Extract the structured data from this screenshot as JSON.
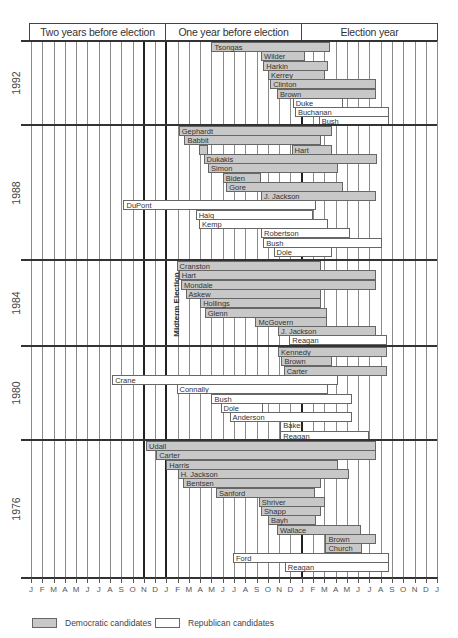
{
  "chart_data": {
    "type": "gantt",
    "title": "",
    "header_periods": [
      "Two years before election",
      "One year before election",
      "Election year"
    ],
    "x_axis": {
      "unit": "month",
      "tick_labels": [
        "J",
        "F",
        "M",
        "A",
        "M",
        "J",
        "J",
        "A",
        "S",
        "O",
        "N",
        "D",
        "J",
        "F",
        "M",
        "A",
        "M",
        "J",
        "J",
        "A",
        "S",
        "O",
        "N",
        "D",
        "J",
        "F",
        "M",
        "A",
        "M",
        "J",
        "J",
        "A",
        "S",
        "O",
        "N",
        "D",
        "J"
      ],
      "origin_note": "month offset 0 = January two years before the election; 24 = January of election year"
    },
    "annotations": [
      {
        "text": "Midterm Election",
        "month": 10
      }
    ],
    "legend": [
      {
        "label": "Democratic candidates",
        "party": "dem",
        "color": "#c8c8c8"
      },
      {
        "label": "Republican candidates",
        "party": "rep",
        "color": "#ffffff"
      }
    ],
    "sections": [
      {
        "year": "1992",
        "candidates": [
          {
            "name": "Tsongas",
            "party": "dem",
            "start": 16.0,
            "end": 26.5
          },
          {
            "name": "Wilder",
            "party": "dem",
            "start": 20.4,
            "end": 24.3
          },
          {
            "name": "Harkin",
            "party": "dem",
            "start": 20.6,
            "end": 26.3
          },
          {
            "name": "Kerrey",
            "party": "dem",
            "start": 21.0,
            "end": 26.1
          },
          {
            "name": "Clinton",
            "party": "dem",
            "start": 21.2,
            "end": 30.6
          },
          {
            "name": "Brown",
            "party": "dem",
            "start": 21.8,
            "end": 30.6
          },
          {
            "name": "Duke",
            "party": "rep",
            "start": 23.2,
            "end": 27.7
          },
          {
            "name": "Buchanan",
            "party": "rep",
            "start": 23.4,
            "end": 31.7
          },
          {
            "name": "Bush",
            "party": "rep",
            "start": 25.5,
            "end": 31.7
          }
        ]
      },
      {
        "year": "1988",
        "candidates": [
          {
            "name": "Gephardt",
            "party": "dem",
            "start": 13.1,
            "end": 26.7
          },
          {
            "name": "Babbit",
            "party": "dem",
            "start": 13.6,
            "end": 25.7
          },
          {
            "name": "Hart",
            "party": "dem",
            "start": 14.9,
            "end": 15.7,
            "label": false
          },
          {
            "name": "Hart",
            "party": "dem",
            "start": 23.1,
            "end": 26.7
          },
          {
            "name": "Dukakis",
            "party": "dem",
            "start": 15.3,
            "end": 30.7
          },
          {
            "name": "Simon",
            "party": "dem",
            "start": 15.7,
            "end": 27.2
          },
          {
            "name": "Biden",
            "party": "dem",
            "start": 17.0,
            "end": 20.4
          },
          {
            "name": "Gore",
            "party": "dem",
            "start": 17.3,
            "end": 27.7
          },
          {
            "name": "J. Jackson",
            "party": "dem",
            "start": 20.4,
            "end": 30.6
          },
          {
            "name": "DuPont",
            "party": "rep",
            "start": 8.2,
            "end": 25.3
          },
          {
            "name": "Haig",
            "party": "rep",
            "start": 14.6,
            "end": 25.0
          },
          {
            "name": "Kemp",
            "party": "rep",
            "start": 14.9,
            "end": 26.3
          },
          {
            "name": "Robertson",
            "party": "rep",
            "start": 20.4,
            "end": 28.3
          },
          {
            "name": "Bush",
            "party": "rep",
            "start": 20.6,
            "end": 31.1
          },
          {
            "name": "Dole",
            "party": "rep",
            "start": 21.5,
            "end": 26.7
          }
        ]
      },
      {
        "year": "1984",
        "candidates": [
          {
            "name": "Cranston",
            "party": "dem",
            "start": 12.9,
            "end": 25.7
          },
          {
            "name": "Hart",
            "party": "dem",
            "start": 13.1,
            "end": 30.6
          },
          {
            "name": "Mondale",
            "party": "dem",
            "start": 13.3,
            "end": 30.6
          },
          {
            "name": "Askew",
            "party": "dem",
            "start": 13.7,
            "end": 25.7
          },
          {
            "name": "Hollings",
            "party": "dem",
            "start": 15.0,
            "end": 25.7
          },
          {
            "name": "Glenn",
            "party": "dem",
            "start": 15.4,
            "end": 26.2
          },
          {
            "name": "McGovern",
            "party": "dem",
            "start": 19.9,
            "end": 26.2
          },
          {
            "name": "J. Jackson",
            "party": "dem",
            "start": 21.9,
            "end": 30.6
          },
          {
            "name": "Reagan",
            "party": "rep",
            "start": 22.9,
            "end": 31.6
          }
        ]
      },
      {
        "year": "1980",
        "candidates": [
          {
            "name": "Kennedy",
            "party": "dem",
            "start": 21.9,
            "end": 31.6
          },
          {
            "name": "Brown",
            "party": "dem",
            "start": 22.2,
            "end": 26.7
          },
          {
            "name": "Carter",
            "party": "dem",
            "start": 22.4,
            "end": 31.6
          },
          {
            "name": "Crane",
            "party": "rep",
            "start": 7.2,
            "end": 27.2
          },
          {
            "name": "Connally",
            "party": "rep",
            "start": 12.9,
            "end": 26.3
          },
          {
            "name": "Bush",
            "party": "rep",
            "start": 16.0,
            "end": 28.5
          },
          {
            "name": "Dole",
            "party": "rep",
            "start": 16.8,
            "end": 20.6
          },
          {
            "name": "Anderson",
            "party": "rep",
            "start": 17.6,
            "end": 28.5
          },
          {
            "name": "Baker",
            "party": "rep",
            "start": 22.1,
            "end": 26.3,
            "label_only": true
          },
          {
            "name": "Reagan",
            "party": "rep",
            "start": 22.1,
            "end": 30.0
          }
        ]
      },
      {
        "year": "1976",
        "candidates": [
          {
            "name": "Udall",
            "party": "dem",
            "start": 10.2,
            "end": 30.6
          },
          {
            "name": "Carter",
            "party": "dem",
            "start": 11.1,
            "end": 30.6
          },
          {
            "name": "Harris",
            "party": "dem",
            "start": 12.0,
            "end": 27.2
          },
          {
            "name": "H. Jackson",
            "party": "dem",
            "start": 13.0,
            "end": 28.2
          },
          {
            "name": "Bentsen",
            "party": "dem",
            "start": 13.5,
            "end": 25.7
          },
          {
            "name": "Sanford",
            "party": "dem",
            "start": 16.4,
            "end": 25.2
          },
          {
            "name": "Shriver",
            "party": "dem",
            "start": 20.2,
            "end": 26.1
          },
          {
            "name": "Shapp",
            "party": "dem",
            "start": 20.4,
            "end": 25.7
          },
          {
            "name": "Bayh",
            "party": "dem",
            "start": 21.0,
            "end": 25.3
          },
          {
            "name": "Wallace",
            "party": "dem",
            "start": 21.8,
            "end": 29.3
          },
          {
            "name": "Brown",
            "party": "dem",
            "start": 26.1,
            "end": 30.6
          },
          {
            "name": "Church",
            "party": "dem",
            "start": 26.1,
            "end": 29.3
          },
          {
            "name": "Ford",
            "party": "rep",
            "start": 17.9,
            "end": 31.7
          },
          {
            "name": "Reagan",
            "party": "rep",
            "start": 22.5,
            "end": 31.7
          }
        ]
      }
    ]
  }
}
